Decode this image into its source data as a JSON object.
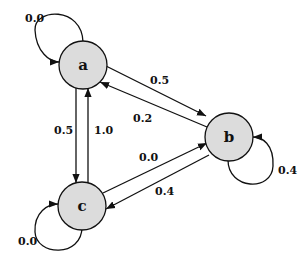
{
  "diagram": {
    "type": "markov-chain",
    "nodes": [
      {
        "id": "a",
        "label": "a"
      },
      {
        "id": "b",
        "label": "b"
      },
      {
        "id": "c",
        "label": "c"
      }
    ],
    "edges": [
      {
        "from": "a",
        "to": "a",
        "label": "0.0"
      },
      {
        "from": "a",
        "to": "b",
        "label": "0.5"
      },
      {
        "from": "b",
        "to": "a",
        "label": "0.2"
      },
      {
        "from": "a",
        "to": "c",
        "label": "0.5"
      },
      {
        "from": "c",
        "to": "a",
        "label": "1.0"
      },
      {
        "from": "c",
        "to": "b",
        "label": "0.0"
      },
      {
        "from": "b",
        "to": "c",
        "label": "0.4"
      },
      {
        "from": "b",
        "to": "b",
        "label": "0.4"
      },
      {
        "from": "c",
        "to": "c",
        "label": "0.0"
      }
    ],
    "colors": {
      "node_fill": "#dcdcdc",
      "stroke": "#111111",
      "background": "#ffffff"
    }
  }
}
